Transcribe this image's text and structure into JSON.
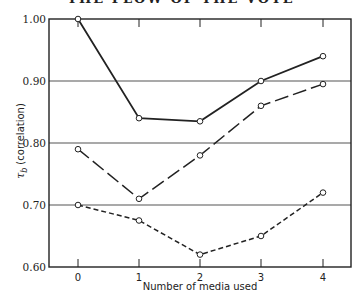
{
  "header": {
    "running_title": "THE FLOW OF THE VOTE"
  },
  "chart_data": {
    "type": "line",
    "title": "",
    "xlabel": "Number of media used",
    "ylabel_symbol": "τ",
    "ylabel_subscript": "b",
    "ylabel_text": "(correlation)",
    "ylabel": "τb (correlation)",
    "x": [
      0,
      1,
      2,
      3,
      4
    ],
    "x_tick_labels": [
      "0",
      "1",
      "2",
      "3",
      "4"
    ],
    "y_tick_labels": [
      "1.00",
      "0.90",
      "0.80",
      "0.70",
      "0.60"
    ],
    "y_ticks": [
      1.0,
      0.9,
      0.8,
      0.7,
      0.6
    ],
    "ylim": [
      0.6,
      1.0
    ],
    "grid": "horizontal",
    "legend": "none",
    "series": [
      {
        "name": "solid",
        "style": "solid",
        "values": [
          1.0,
          0.84,
          0.835,
          0.9,
          0.94
        ]
      },
      {
        "name": "long-dashed",
        "style": "long-dash",
        "values": [
          0.79,
          0.71,
          0.78,
          0.86,
          0.895
        ]
      },
      {
        "name": "short-dashed",
        "style": "short-dash",
        "values": [
          0.7,
          0.675,
          0.62,
          0.65,
          0.72
        ]
      }
    ],
    "colors": {
      "line": "#222222",
      "grid": "#555555",
      "marker_fill": "#ffffff"
    }
  }
}
